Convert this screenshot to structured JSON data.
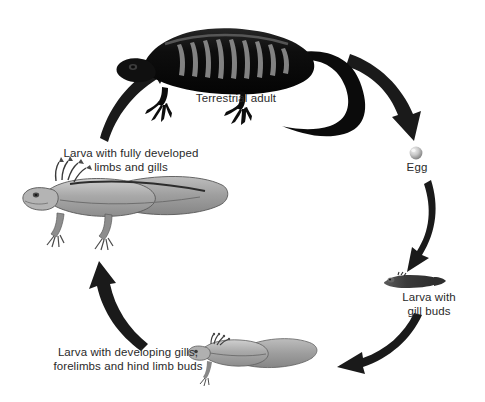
{
  "diagram": {
    "background_color": "#ffffff",
    "text_color": "#2a2a2a",
    "arrow_color": "#1a1a1a",
    "stages": [
      {
        "id": "terrestrial-adult",
        "label": "Terrestrial adult",
        "order": 1,
        "organism": "adult salamander",
        "color": "#151515"
      },
      {
        "id": "egg",
        "label": "Egg",
        "order": 2,
        "organism": "egg sphere",
        "color": "#b9b9b9"
      },
      {
        "id": "larva-gill-buds",
        "label": "Larva with\ngill buds",
        "order": 3,
        "organism": "tiny larva",
        "color": "#4a4a4a"
      },
      {
        "id": "larva-developing",
        "label": "Larva with developing gills,\nforelimbs and hind limb buds",
        "order": 4,
        "organism": "larva with forelimbs",
        "color": "#9b9b9b"
      },
      {
        "id": "larva-fully-developed",
        "label": "Larva with fully developed\nlimbs and gills",
        "order": 5,
        "organism": "larva with four limbs and gills",
        "color": "#a8a8a8"
      }
    ],
    "arrows": [
      {
        "id": "arrow-adult-to-egg",
        "from": "terrestrial-adult",
        "to": "egg",
        "direction": "down-right"
      },
      {
        "id": "arrow-egg-to-gill-buds",
        "from": "egg",
        "to": "larva-gill-buds",
        "direction": "down"
      },
      {
        "id": "arrow-gill-buds-to-developing",
        "from": "larva-gill-buds",
        "to": "larva-developing",
        "direction": "down-left"
      },
      {
        "id": "arrow-developing-to-fully-developed",
        "from": "larva-developing",
        "to": "larva-fully-developed",
        "direction": "up"
      },
      {
        "id": "arrow-fully-developed-to-adult",
        "from": "larva-fully-developed",
        "to": "terrestrial-adult",
        "direction": "up-right"
      }
    ]
  }
}
